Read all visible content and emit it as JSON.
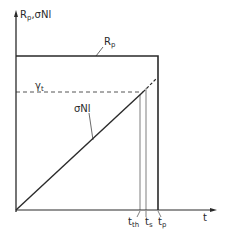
{
  "diagram": {
    "y_axis_label": "R",
    "y_axis_label_sub": "p",
    "y_axis_label_rest": ",σNl",
    "x_axis_label": "t",
    "curves": {
      "rp": {
        "label": "R",
        "label_sub": "p"
      },
      "gamma_t": {
        "label": "γ",
        "label_sub": "t"
      },
      "sigma_nl": {
        "label": "σNl"
      }
    },
    "time_markers": [
      {
        "label": "t",
        "sub": "th"
      },
      {
        "label": "t",
        "sub": "s"
      },
      {
        "label": "t",
        "sub": "p"
      }
    ],
    "colors": {
      "line": "#2a2a2a",
      "background": "#ffffff"
    }
  }
}
